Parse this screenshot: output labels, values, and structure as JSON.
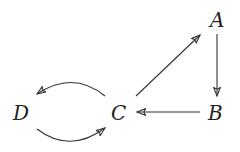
{
  "diagram": {
    "type": "directed-graph",
    "nodes": [
      {
        "id": "A",
        "label": "A"
      },
      {
        "id": "B",
        "label": "B"
      },
      {
        "id": "C",
        "label": "C"
      },
      {
        "id": "D",
        "label": "D"
      }
    ],
    "edges": [
      {
        "from": "A",
        "to": "B"
      },
      {
        "from": "B",
        "to": "C"
      },
      {
        "from": "C",
        "to": "A"
      },
      {
        "from": "C",
        "to": "D",
        "curved": "upper"
      },
      {
        "from": "D",
        "to": "C",
        "curved": "lower"
      }
    ]
  }
}
